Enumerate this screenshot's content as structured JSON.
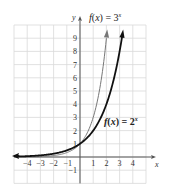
{
  "chart_data": {
    "type": "line",
    "title": "",
    "xlabel": "x",
    "ylabel": "y",
    "xlim": [
      -5,
      5
    ],
    "ylim": [
      -2,
      10
    ],
    "grid": true,
    "x_ticks": [
      -4,
      -3,
      -2,
      -1,
      1,
      2,
      3,
      4
    ],
    "y_ticks": [
      -1,
      1,
      2,
      3,
      4,
      5,
      6,
      7,
      8,
      9
    ],
    "x_tick_labels": [
      "−4",
      "−3",
      "−2",
      "−1",
      "1",
      "2",
      "3",
      "4"
    ],
    "y_tick_labels": [
      "−1",
      "1",
      "2",
      "3",
      "4",
      "5",
      "6",
      "7",
      "8",
      "9"
    ],
    "series": [
      {
        "name": "f(x) = 3^x",
        "label_main": "f(x) = 3",
        "label_exp": "x",
        "color": "#777777",
        "x": [
          -5,
          -4,
          -3,
          -2,
          -1,
          0,
          1,
          2
        ],
        "y": [
          0.004,
          0.012,
          0.037,
          0.111,
          0.333,
          1,
          3,
          9
        ]
      },
      {
        "name": "f(x) = 2^x",
        "label_main": "f(x) = 2",
        "label_exp": "x",
        "color": "#111111",
        "x": [
          -5,
          -4,
          -3,
          -2,
          -1,
          0,
          1,
          2,
          3
        ],
        "y": [
          0.031,
          0.0625,
          0.125,
          0.25,
          0.5,
          1,
          2,
          4,
          8
        ]
      }
    ]
  },
  "colors": {
    "grid": "#d9d9d9",
    "axis": "#555555",
    "background": "#ffffff"
  }
}
